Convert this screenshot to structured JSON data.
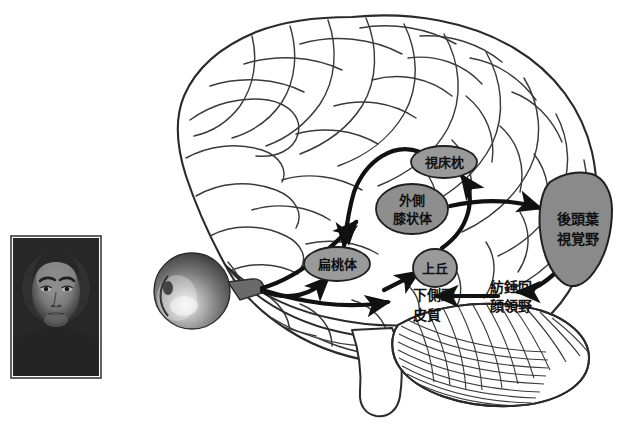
{
  "figure": {
    "kind": "neuroanatomy-diagram",
    "background_color": "#ffffff",
    "ink_color": "#1a1a1a"
  },
  "photo": {
    "name": "face-photograph",
    "alt_text": "",
    "frame_color": "#2b2b2b",
    "fill_color": "#6f6f6f"
  },
  "eye": {
    "name": "eyeball",
    "fill_color": "#5c5c5c"
  },
  "regions": [
    {
      "id": "pulvinar",
      "label": "視床枕",
      "lines": [
        "視床枕"
      ],
      "shape": "ellipse",
      "fill": "#9a9a9a",
      "cx": 444,
      "cy": 162,
      "rx": 33,
      "ry": 16
    },
    {
      "id": "lateral-geniculate",
      "label": "外側膝状体",
      "lines": [
        "外側",
        "膝状体"
      ],
      "shape": "ellipse",
      "fill": "#8e8e8e",
      "cx": 412,
      "cy": 209,
      "rx": 36,
      "ry": 25
    },
    {
      "id": "amygdala",
      "label": "扁桃体",
      "lines": [
        "扁桃体"
      ],
      "shape": "ellipse",
      "fill": "#9a9a9a",
      "cx": 337,
      "cy": 264,
      "rx": 33,
      "ry": 17
    },
    {
      "id": "superior-colliculus",
      "label": "上丘",
      "lines": [
        "上丘"
      ],
      "shape": "ellipse",
      "fill": "#9a9a9a",
      "cx": 435,
      "cy": 268,
      "rx": 22,
      "ry": 19
    },
    {
      "id": "occipital-visual-cortex",
      "label": "後頭葉視覚野",
      "lines": [
        "後頭葉",
        "視覚野"
      ],
      "shape": "polygon",
      "fill": "#8a8a8a",
      "cx": 578,
      "cy": 228
    }
  ],
  "free_labels": [
    {
      "id": "inferior-temporal-cortex",
      "label": "下側頭皮質",
      "lines": [
        "下側頭",
        "皮質"
      ],
      "x": 413,
      "y": 300
    },
    {
      "id": "fusiform-face-area",
      "label": "紡錘回顔領野",
      "lines": [
        "紡錘回",
        "顔領野"
      ],
      "x": 514,
      "y": 293
    }
  ],
  "connections": [
    {
      "id": "eye-to-lgn",
      "from": "eyeball",
      "to": "lateral-geniculate",
      "style": "curved-arrow"
    },
    {
      "id": "eye-to-it",
      "from": "eyeball",
      "to": "inferior-temporal-cortex",
      "style": "curved-arrow"
    },
    {
      "id": "eye-to-amygdala",
      "from": "eyeball",
      "to": "amygdala",
      "style": "curved-arrow"
    },
    {
      "id": "pulvinar-to-amygdala",
      "from": "pulvinar",
      "to": "amygdala",
      "style": "curved-arrow"
    },
    {
      "id": "lgn-to-occipital",
      "from": "lateral-geniculate",
      "to": "occipital-visual-cortex",
      "style": "straight-arrow"
    },
    {
      "id": "sc-to-pulvinar",
      "from": "superior-colliculus",
      "to": "pulvinar",
      "style": "curved-arrow"
    },
    {
      "id": "it-to-sc",
      "from": "inferior-temporal-cortex",
      "to": "superior-colliculus",
      "style": "straight-arrow"
    },
    {
      "id": "ffa-to-it",
      "from": "fusiform-face-area",
      "to": "inferior-temporal-cortex",
      "style": "straight-arrow"
    },
    {
      "id": "occipital-to-ffa",
      "from": "occipital-visual-cortex",
      "to": "fusiform-face-area",
      "style": "curved-arrow"
    }
  ]
}
